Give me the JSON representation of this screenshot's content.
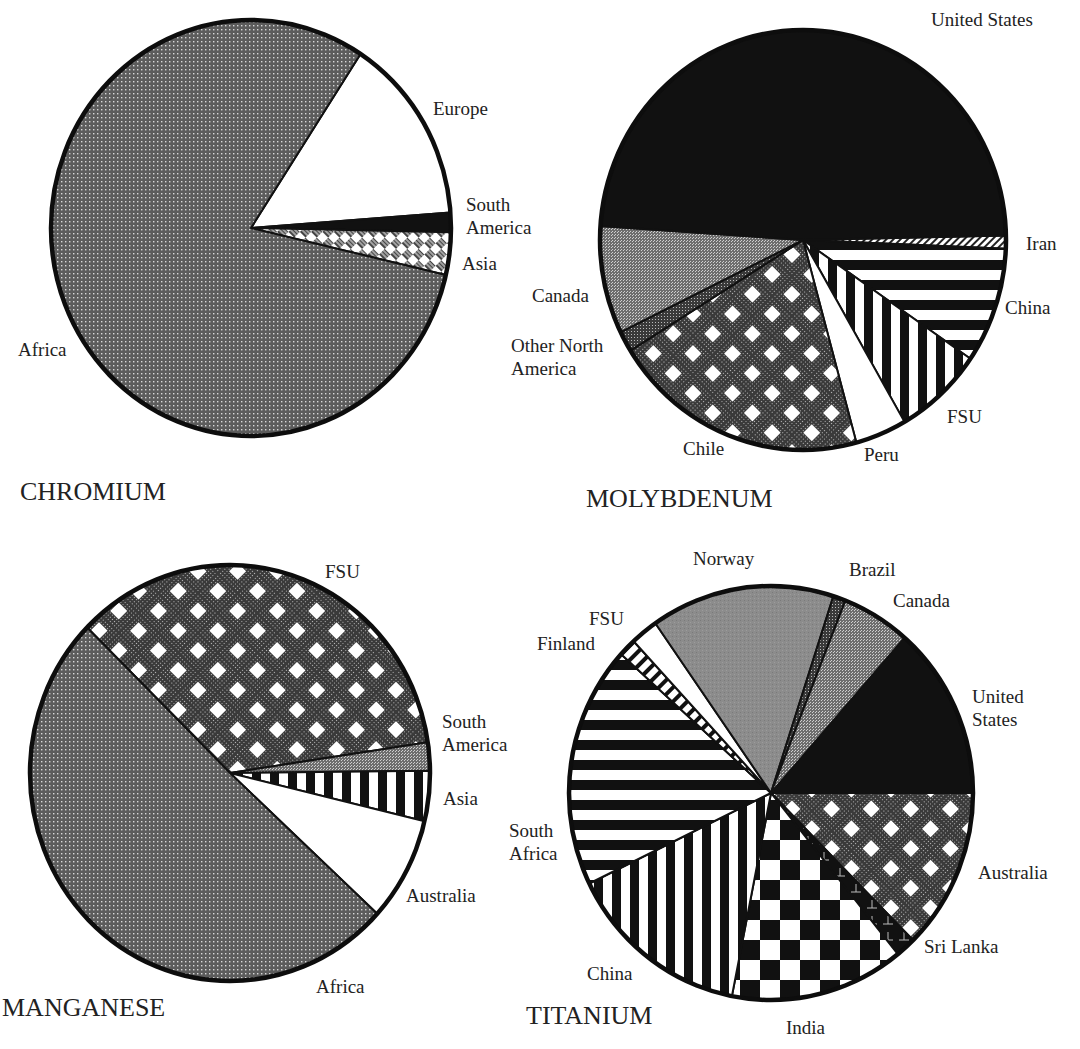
{
  "chart_data": [
    {
      "type": "pie",
      "title": "CHROMIUM",
      "center": [
        251,
        228
      ],
      "radius": [
        200,
        208
      ],
      "start_angle_deg": -56.8,
      "slices": [
        {
          "label": "Europe",
          "value": 14.6,
          "pattern": "white"
        },
        {
          "label": "South America",
          "value": 1.5,
          "pattern": "black"
        },
        {
          "label": "Asia",
          "value": 3.3,
          "pattern": "hatch-diamond"
        },
        {
          "label": "Africa",
          "value": 80.6,
          "pattern": "dots-gray"
        }
      ],
      "labels_pos": [
        {
          "text": "Europe",
          "x": 433,
          "y": 97
        },
        {
          "text": "South\nAmerica",
          "x": 466,
          "y": 193
        },
        {
          "text": "Asia",
          "x": 462,
          "y": 252
        },
        {
          "text": "Africa",
          "x": 18,
          "y": 338
        }
      ],
      "title_pos": {
        "x": 20,
        "y": 477
      }
    },
    {
      "type": "pie",
      "title": "MOLYBDENUM",
      "center": [
        803,
        240
      ],
      "radius": [
        203,
        210
      ],
      "start_angle_deg": -1.2,
      "slices": [
        {
          "label": "Iran",
          "value": 1.0,
          "pattern": "hatch-fine"
        },
        {
          "label": "China",
          "value": 8.9,
          "pattern": "hstripes"
        },
        {
          "label": "FSU",
          "value": 7.1,
          "pattern": "vstripes"
        },
        {
          "label": "Peru",
          "value": 4.1,
          "pattern": "white"
        },
        {
          "label": "Chile",
          "value": 20.4,
          "pattern": "diamond-check"
        },
        {
          "label": "Other North America",
          "value": 1.6,
          "pattern": "dense-gray"
        },
        {
          "label": "Canada",
          "value": 8.3,
          "pattern": "stipple-gray"
        },
        {
          "label": "United States",
          "value": 48.6,
          "pattern": "black"
        }
      ],
      "labels_pos": [
        {
          "text": "United States",
          "x": 931,
          "y": 8
        },
        {
          "text": "Iran",
          "x": 1026,
          "y": 232
        },
        {
          "text": "China",
          "x": 1005,
          "y": 296
        },
        {
          "text": "FSU",
          "x": 947,
          "y": 405
        },
        {
          "text": "Peru",
          "x": 864,
          "y": 443
        },
        {
          "text": "Chile",
          "x": 683,
          "y": 437
        },
        {
          "text": "Canada",
          "x": 532,
          "y": 284
        },
        {
          "text": "Other North\nAmerica",
          "x": 511,
          "y": 334
        }
      ],
      "title_pos": {
        "x": 586,
        "y": 484
      }
    },
    {
      "type": "pie",
      "title": "MANGANESE",
      "center": [
        230,
        773
      ],
      "radius": [
        200,
        208
      ],
      "start_angle_deg": -135.6,
      "slices": [
        {
          "label": "FSU",
          "value": 35.3,
          "pattern": "diamond-check"
        },
        {
          "label": "South America",
          "value": 2.2,
          "pattern": "stipple-gray"
        },
        {
          "label": "Asia",
          "value": 3.9,
          "pattern": "vstripes"
        },
        {
          "label": "Australia",
          "value": 8.1,
          "pattern": "white"
        },
        {
          "label": "Africa",
          "value": 50.5,
          "pattern": "dots-gray"
        }
      ],
      "labels_pos": [
        {
          "text": "FSU",
          "x": 325,
          "y": 560
        },
        {
          "text": "South\nAmerica",
          "x": 442,
          "y": 710
        },
        {
          "text": "Asia",
          "x": 443,
          "y": 787
        },
        {
          "text": "Australia",
          "x": 406,
          "y": 884
        },
        {
          "text": "Africa",
          "x": 316,
          "y": 975
        }
      ],
      "title_pos": {
        "x": 2,
        "y": 993
      }
    },
    {
      "type": "pie",
      "title": "TITANIUM",
      "center": [
        771,
        793
      ],
      "radius": [
        202,
        207
      ],
      "start_angle_deg": -48.6,
      "slices": [
        {
          "label": "United States",
          "value": 13.5,
          "pattern": "black"
        },
        {
          "label": "Australia",
          "value": 12.6,
          "pattern": "diamond-check"
        },
        {
          "label": "Sri Lanka",
          "value": 1.6,
          "pattern": "tick-black"
        },
        {
          "label": "India",
          "value": 13.9,
          "pattern": "checker"
        },
        {
          "label": "China",
          "value": 14.7,
          "pattern": "vstripes"
        },
        {
          "label": "South Africa",
          "value": 18.9,
          "pattern": "hstripes"
        },
        {
          "label": "Finland",
          "value": 1.4,
          "pattern": "vstripes-fine"
        },
        {
          "label": "FSU",
          "value": 2.2,
          "pattern": "white"
        },
        {
          "label": "Norway",
          "value": 14.7,
          "pattern": "solid-gray"
        },
        {
          "label": "Brazil",
          "value": 1.0,
          "pattern": "dense-gray"
        },
        {
          "label": "Canada",
          "value": 5.5,
          "pattern": "stipple-gray"
        }
      ],
      "labels_pos": [
        {
          "text": "Norway",
          "x": 693,
          "y": 547
        },
        {
          "text": "Brazil",
          "x": 849,
          "y": 558
        },
        {
          "text": "Canada",
          "x": 893,
          "y": 589
        },
        {
          "text": "FSU",
          "x": 589,
          "y": 607
        },
        {
          "text": "Finland",
          "x": 537,
          "y": 632
        },
        {
          "text": "United\nStates",
          "x": 972,
          "y": 685
        },
        {
          "text": "South\nAfrica",
          "x": 509,
          "y": 819
        },
        {
          "text": "Australia",
          "x": 978,
          "y": 861
        },
        {
          "text": "Sri Lanka",
          "x": 924,
          "y": 935
        },
        {
          "text": "China",
          "x": 587,
          "y": 962
        },
        {
          "text": "India",
          "x": 786,
          "y": 1016
        }
      ],
      "title_pos": {
        "x": 526,
        "y": 1001
      }
    }
  ],
  "patterns": {
    "black": "#111111",
    "white": "#ffffff",
    "gray": "#8a8a8a",
    "dark": "#2a2a2a"
  }
}
